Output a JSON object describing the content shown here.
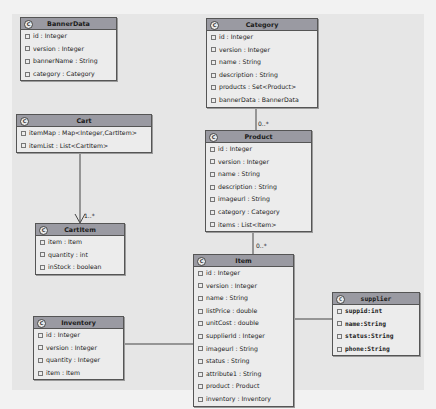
{
  "diagram": {
    "type": "uml-class-diagram",
    "classes": {
      "bannerdata": {
        "name": "BannerData",
        "attributes": [
          "id : Integer",
          "version : Integer",
          "bannerName : String",
          "category : Category"
        ]
      },
      "category": {
        "name": "Category",
        "attributes": [
          "id : Integer",
          "version : Integer",
          "name : String",
          "description : String",
          "products : Set<Product>",
          "bannerData : BannerData"
        ]
      },
      "cart": {
        "name": "Cart",
        "attributes": [
          "itemMap : Map<Integer,CartItem>",
          "itemList : List<CartItem>"
        ]
      },
      "product": {
        "name": "Product",
        "attributes": [
          "id : Integer",
          "version : Integer",
          "name : String",
          "description : String",
          "imageurl : String",
          "category : Category",
          "items : List<Item>"
        ]
      },
      "cartitem": {
        "name": "CartItem",
        "attributes": [
          "item : Item",
          "quantity : int",
          "inStock : boolean"
        ]
      },
      "item": {
        "name": "Item",
        "attributes": [
          "id : Integer",
          "version : Integer",
          "name : String",
          "listPrice : double",
          "unitCost : double",
          "supplierId : Integer",
          "imageurl : String",
          "status : String",
          "attribute1 : String",
          "product : Product",
          "inventory : Inventory"
        ]
      },
      "inventory": {
        "name": "Inventory",
        "attributes": [
          "id : Integer",
          "version : Integer",
          "quantity : Integer",
          "item : Item"
        ]
      },
      "supplier": {
        "name": "supplier",
        "attributes": [
          "suppid:int",
          "name:String",
          "status:String",
          "phone:String"
        ]
      }
    },
    "relationships": [
      {
        "from": "Category",
        "to": "Product",
        "multiplicity": "0..*"
      },
      {
        "from": "Product",
        "to": "Item",
        "multiplicity": "0..*"
      },
      {
        "from": "Cart",
        "to": "CartItem",
        "multiplicity": "1..*",
        "arrow": "open"
      },
      {
        "from": "Inventory",
        "to": "Item",
        "multiplicity": ""
      },
      {
        "from": "Item",
        "to": "supplier",
        "multiplicity": ""
      }
    ],
    "class_icon": "C"
  }
}
